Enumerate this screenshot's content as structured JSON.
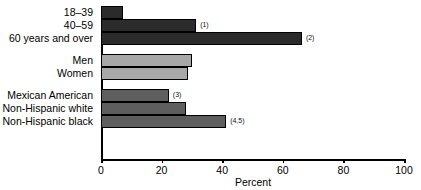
{
  "chart_data": {
    "type": "bar",
    "orientation": "horizontal",
    "title": "",
    "xlabel": "Percent",
    "ylabel": "",
    "xlim": [
      0,
      100
    ],
    "xticks": [
      0,
      20,
      40,
      60,
      80,
      100
    ],
    "xtick_labels": [
      "0",
      "20",
      "40",
      "60",
      "80",
      "100"
    ],
    "grid": false,
    "legend": "none",
    "categories": [
      "18–39",
      "40–59",
      "60 years and over",
      "Men",
      "Women",
      "Mexican American",
      "Non-Hispanic white",
      "Non-Hispanic black"
    ],
    "values": [
      7.3,
      31.4,
      66.3,
      30.0,
      28.7,
      22.4,
      28.0,
      41.3
    ],
    "annotations": [
      "",
      "(1)",
      "(2)",
      "",
      "",
      "(3)",
      "",
      "(4,5)"
    ],
    "group_of_bar": [
      "age",
      "age",
      "age",
      "sex",
      "sex",
      "race",
      "race",
      "race"
    ],
    "bars": [
      {
        "label": "18–39",
        "value": 7.3,
        "note": "",
        "color": "#2b2b2b",
        "group": "age"
      },
      {
        "label": "40–59",
        "value": 31.4,
        "note": "(1)",
        "color": "#2b2b2b",
        "group": "age"
      },
      {
        "label": "60 years and over",
        "value": 66.3,
        "note": "(2)",
        "color": "#2b2b2b",
        "group": "age"
      },
      {
        "label": "Men",
        "value": 30.0,
        "note": "",
        "color": "#a8a8a8",
        "group": "sex"
      },
      {
        "label": "Women",
        "value": 28.7,
        "note": "",
        "color": "#a8a8a8",
        "group": "sex"
      },
      {
        "label": "Mexican American",
        "value": 22.4,
        "note": "(3)",
        "color": "#5e5e5e",
        "group": "race"
      },
      {
        "label": "Non-Hispanic white",
        "value": 28.0,
        "note": "",
        "color": "#5e5e5e",
        "group": "race"
      },
      {
        "label": "Non-Hispanic black",
        "value": 41.3,
        "note": "(4,5)",
        "color": "#5e5e5e",
        "group": "race"
      }
    ],
    "colors": {
      "age_group": "#2b2b2b",
      "sex_group": "#a8a8a8",
      "race_group": "#5e5e5e",
      "axis": "#000000",
      "background": "#ffffff"
    }
  }
}
